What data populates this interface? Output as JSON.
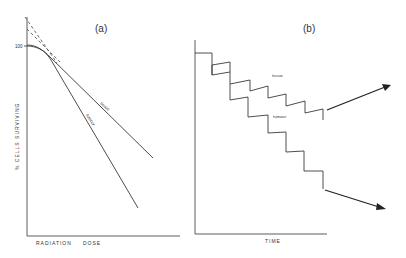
{
  "figure": {
    "panels": [
      {
        "id": "a",
        "label": "(a)",
        "type": "dose-survival-curve",
        "y_axis_label": "% CELLS SURVIVING",
        "x_axis_label_1": "RADIATION",
        "x_axis_label_2": "DOSE",
        "y_tick_label": "100",
        "curves": [
          {
            "name": "tissue",
            "label": "tissue"
          },
          {
            "name": "tumour",
            "label": "tumour"
          }
        ],
        "extrapolation": "dashed lines extrapolating linear portions back to y-axis"
      },
      {
        "id": "b",
        "label": "(b)",
        "type": "fractionated-dose-response",
        "x_axis_label": "TIME",
        "curves": [
          {
            "name": "tissue",
            "label": "tissue"
          },
          {
            "name": "tumour",
            "label": "tumour"
          }
        ],
        "arrows": [
          "tissue trend upward",
          "tumour trend downward"
        ]
      }
    ],
    "colors": {
      "background": "#ffffff",
      "line": "#3a3a3a",
      "text": "#333333"
    }
  }
}
